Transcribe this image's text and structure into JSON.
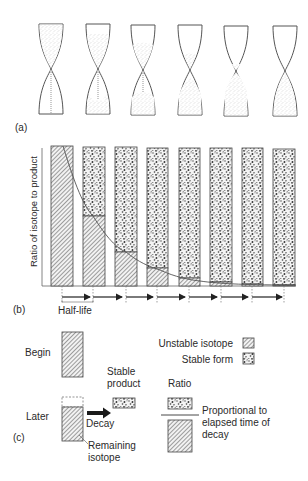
{
  "panel_a": {
    "label": "(a)",
    "hourglasses": [
      {
        "x": 38,
        "top_fill": 1.0,
        "bottom_fill": 0.0
      },
      {
        "x": 85,
        "top_fill": 0.75,
        "bottom_fill": 0.25
      },
      {
        "x": 130,
        "top_fill": 0.5,
        "bottom_fill": 0.5
      },
      {
        "x": 177,
        "top_fill": 0.25,
        "bottom_fill": 0.75
      },
      {
        "x": 223,
        "top_fill": 0.1,
        "bottom_fill": 0.9
      },
      {
        "x": 272,
        "top_fill": 0.0,
        "bottom_fill": 1.0
      }
    ]
  },
  "panel_b": {
    "label": "(b)",
    "y_axis_label": "Ratio of isotope to product",
    "half_life_label": "Half-life",
    "bars": [
      {
        "x": 51,
        "isotope_fraction": 1.0
      },
      {
        "x": 83,
        "isotope_fraction": 0.5
      },
      {
        "x": 115,
        "isotope_fraction": 0.24
      },
      {
        "x": 147,
        "isotope_fraction": 0.13
      },
      {
        "x": 179,
        "isotope_fraction": 0.05
      },
      {
        "x": 210,
        "isotope_fraction": 0.025
      },
      {
        "x": 242,
        "isotope_fraction": 0.012
      },
      {
        "x": 273,
        "isotope_fraction": 0.006
      }
    ],
    "ticks": [
      62,
      93,
      126,
      157,
      189,
      221,
      252,
      284
    ]
  },
  "panel_c": {
    "label": "(c)",
    "begin_label": "Begin",
    "later_label": "Later",
    "decay_label": "Decay",
    "stable_product_line1": "Stable",
    "stable_product_line2": "product",
    "remaining_line1": "Remaining",
    "remaining_line2": "isotope",
    "ratio_label": "Ratio",
    "proportional_line1": "Proportional to",
    "proportional_line2": "elapsed time of",
    "proportional_line3": "decay",
    "legend": {
      "unstable": "Unstable isotope",
      "stable": "Stable form"
    }
  },
  "colors": {
    "ink": "#2a2a2a",
    "line": "#555555",
    "sand": "#9a9a9a"
  }
}
